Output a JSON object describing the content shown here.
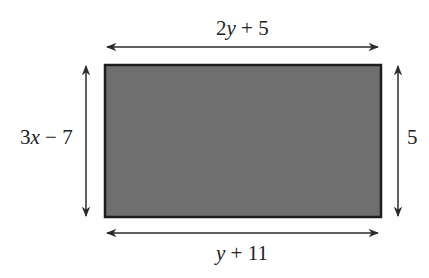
{
  "diagram": {
    "type": "rectangle-with-dimension-labels",
    "colors": {
      "fill": "#6f6f6f",
      "stroke": "#1e1e1e",
      "arrow": "#2a2a2a",
      "text": "#222222"
    },
    "labels": {
      "top": {
        "var": "2",
        "italic": "y",
        "rest": " + 5"
      },
      "bottom": {
        "var": "",
        "italic": "y",
        "rest": " + 11"
      },
      "left": {
        "var": "3",
        "italic": "x",
        "rest": " − 7"
      },
      "right": {
        "var": "5",
        "italic": "",
        "rest": ""
      }
    }
  }
}
